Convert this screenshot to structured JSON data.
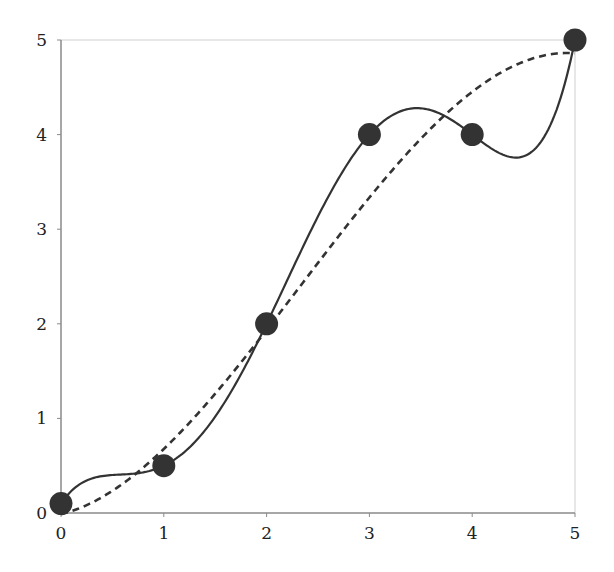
{
  "chart_data": {
    "type": "line",
    "title": "",
    "xlabel": "",
    "ylabel": "",
    "xlim": [
      0,
      5
    ],
    "ylim": [
      0,
      5
    ],
    "x_ticks": [
      "0",
      "1",
      "2",
      "3",
      "4",
      "5"
    ],
    "y_ticks": [
      "0",
      "1",
      "2",
      "3",
      "4",
      "5"
    ],
    "grid": false,
    "legend": null,
    "points": {
      "name": "data points",
      "x": [
        0,
        1,
        2,
        3,
        4,
        5
      ],
      "y": [
        0.1,
        0.5,
        2,
        4,
        4,
        5
      ],
      "marker": "filled-circle",
      "color": "#333333"
    },
    "series": [
      {
        "name": "interpolating polynomial (solid)",
        "style": "solid",
        "color": "#333333",
        "x": [
          0,
          0.5,
          1,
          1.5,
          2,
          2.5,
          3,
          3.5,
          4,
          4.43,
          4.75,
          5
        ],
        "y": [
          0.1,
          0.4,
          0.5,
          1.05,
          2,
          3.1,
          4,
          4.28,
          4,
          3.75,
          4.1,
          5
        ]
      },
      {
        "name": "least-squares fit (dashed)",
        "style": "dashed",
        "color": "#333333",
        "x": [
          0,
          1,
          2,
          3,
          4,
          4.8,
          5
        ],
        "y": [
          0.0,
          0.63,
          2.0,
          3.3,
          4.45,
          4.87,
          4.85
        ]
      }
    ]
  },
  "colors": {
    "axis": "#8a8a8a",
    "frame": "#cfcfcf",
    "ink": "#333333",
    "text": "#222222"
  }
}
